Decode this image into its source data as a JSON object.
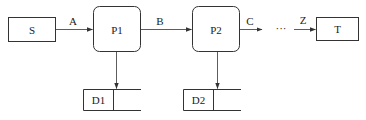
{
  "diagram": {
    "type": "data-flow",
    "colors": {
      "stroke": "#333333",
      "background": "#ffffff",
      "text": "#222222"
    },
    "entities": {
      "source": {
        "label": "S"
      },
      "target": {
        "label": "T"
      }
    },
    "processes": [
      {
        "label": "P1"
      },
      {
        "label": "P2"
      }
    ],
    "stores": [
      {
        "label": "D1"
      },
      {
        "label": "D2"
      }
    ],
    "flows": [
      {
        "label": "A",
        "from": "S",
        "to": "P1"
      },
      {
        "label": "B",
        "from": "P1",
        "to": "P2"
      },
      {
        "label": "C",
        "from": "P2",
        "to": "..."
      },
      {
        "label": "Z",
        "from": "...",
        "to": "T"
      }
    ],
    "ellipsis": "···"
  }
}
